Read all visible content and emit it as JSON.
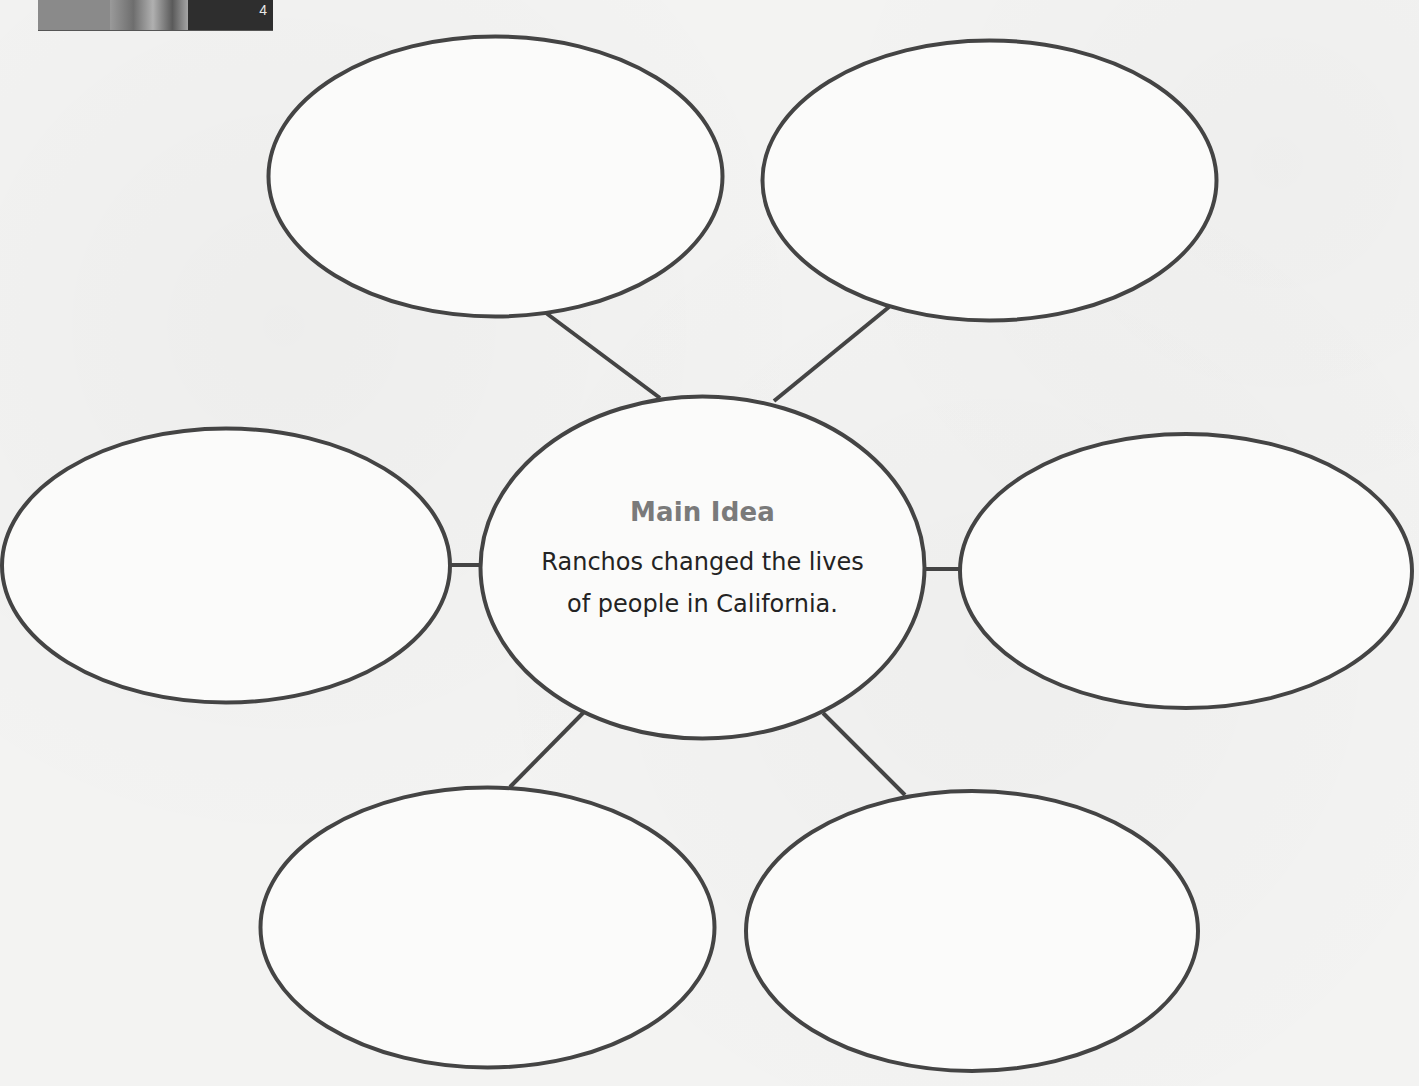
{
  "page": {
    "number_badge": "4"
  },
  "diagram": {
    "type": "main-idea-web",
    "colors": {
      "background": "#f3f3f2",
      "stroke": "#444444",
      "title": "#7a7a7a",
      "body_text": "#232323"
    },
    "center": {
      "title": "Main Idea",
      "text": "Ranchos changed the lives of people in California.",
      "text_line_1": "Ranchos changed the lives",
      "text_line_2": "of people in California."
    },
    "detail_bubbles": [
      {
        "position": "top-left",
        "text": ""
      },
      {
        "position": "top-right",
        "text": ""
      },
      {
        "position": "left",
        "text": ""
      },
      {
        "position": "right",
        "text": ""
      },
      {
        "position": "bottom-left",
        "text": ""
      },
      {
        "position": "bottom-right",
        "text": ""
      }
    ]
  }
}
